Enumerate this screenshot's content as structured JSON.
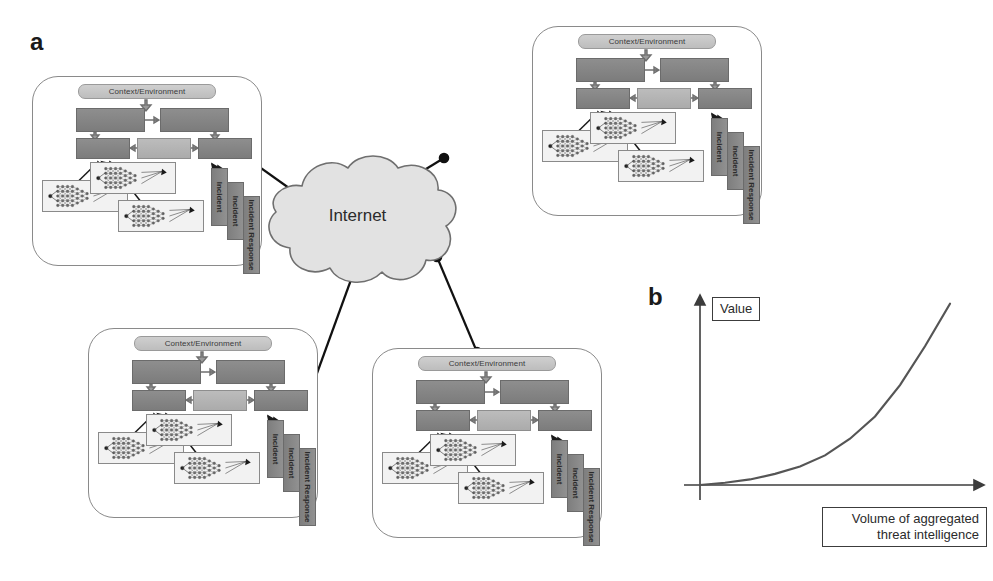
{
  "figure": {
    "panel_a_letter": "a",
    "panel_b_letter": "b",
    "cloud_label": "Internet"
  },
  "org_node": {
    "context_label": "Context/Environment",
    "incident_labels": [
      "Incident",
      "Incident",
      "Incident Response"
    ],
    "process_boxes": [
      "",
      "",
      "",
      "",
      ""
    ],
    "network_thumbnails": 3
  },
  "organizations": [
    {
      "id": "org-top-left",
      "context_label": "Context/Environment"
    },
    {
      "id": "org-top-right",
      "context_label": "Context/Environment"
    },
    {
      "id": "org-bottom-left",
      "context_label": "Context/Environment"
    },
    {
      "id": "org-bottom-right",
      "context_label": "Context/Environment"
    }
  ],
  "chart_data": {
    "type": "line",
    "title": "",
    "xlabel": "Volume of aggregated threat intelligence",
    "ylabel": "Value",
    "xlim": [
      0,
      10
    ],
    "ylim": [
      0,
      10
    ],
    "grid": false,
    "legend": "none",
    "x": [
      0,
      1,
      2,
      3,
      4,
      5,
      6,
      7,
      8,
      9,
      10
    ],
    "y": [
      0.0,
      0.12,
      0.3,
      0.6,
      1.0,
      1.6,
      2.5,
      3.7,
      5.4,
      7.5,
      9.8
    ],
    "annotation": "Value grows exponentially with volume of aggregated threat intelligence"
  },
  "colors": {
    "node_border": "#8a8a8a",
    "box_dark": "#848484",
    "box_light": "#b4b4b4",
    "cloud_fill": "#e2e2e2",
    "cloud_stroke": "#6f6f6f",
    "link": "#111111",
    "curve": "#555555",
    "axis": "#3c3c3c"
  }
}
